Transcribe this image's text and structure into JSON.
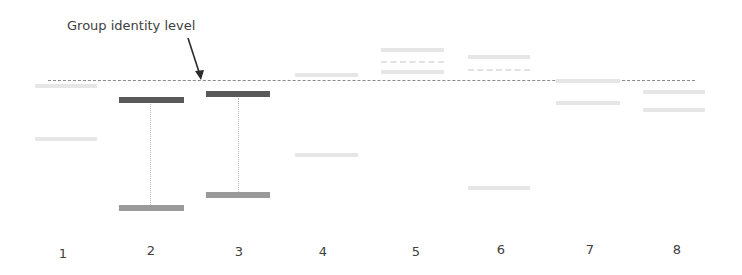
{
  "annotation": {
    "label": "Group identity level",
    "arrow": {
      "from": [
        188,
        38
      ],
      "to": [
        200,
        78
      ]
    }
  },
  "reference_line": {
    "y": 80,
    "x1": 48,
    "x2": 695,
    "style": "dotted"
  },
  "columns": [
    {
      "label": "1",
      "x": 63,
      "state": "faded"
    },
    {
      "label": "2",
      "x": 151,
      "state": "highlighted"
    },
    {
      "label": "3",
      "x": 239,
      "state": "highlighted"
    },
    {
      "label": "4",
      "x": 323,
      "state": "faded"
    },
    {
      "label": "5",
      "x": 416,
      "state": "faded"
    },
    {
      "label": "6",
      "x": 501,
      "state": "faded"
    },
    {
      "label": "7",
      "x": 590,
      "state": "faded"
    },
    {
      "label": "8",
      "x": 677,
      "state": "faded"
    }
  ],
  "colors": {
    "upper_bar": "#595959",
    "lower_bar": "#9a9a9a",
    "faded_bar": "#e6e6e6",
    "reference_line": "#8a8a8a",
    "text": "#404040"
  }
}
